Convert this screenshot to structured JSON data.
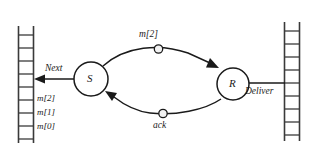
{
  "figure": {
    "type": "protocol-state-diagram",
    "nodes": [
      {
        "id": "sender",
        "label": "S",
        "cx": 91,
        "cy": 79,
        "r": 17
      },
      {
        "id": "receiver",
        "label": "R",
        "cx": 233,
        "cy": 84,
        "r": 16
      }
    ],
    "edges": [
      {
        "id": "data-edge",
        "label": "m[2]",
        "from": "S",
        "to": "R",
        "direction": "right",
        "dot": true
      },
      {
        "id": "ack-edge",
        "label": "ack",
        "from": "R",
        "to": "S",
        "direction": "left",
        "dot": true
      }
    ],
    "actions": [
      {
        "id": "next-action",
        "label": "Next",
        "direction": "left",
        "target": "left-buffer"
      },
      {
        "id": "deliver-action",
        "label": "Deliver",
        "direction": "right",
        "target": "right-buffer"
      }
    ],
    "buffers": [
      {
        "id": "left-buffer",
        "side": "left",
        "rungs": 9,
        "slots": [
          {
            "label": "m[2]"
          },
          {
            "label": "m[1]"
          },
          {
            "label": "m[0]"
          }
        ]
      },
      {
        "id": "right-buffer",
        "side": "right",
        "rungs": 9,
        "slots": []
      }
    ],
    "colors": {
      "stroke": "#1a1a1a",
      "buffer_stroke": "#3a3a3a",
      "fill": "#ffffff",
      "background": "#ffffff"
    }
  }
}
